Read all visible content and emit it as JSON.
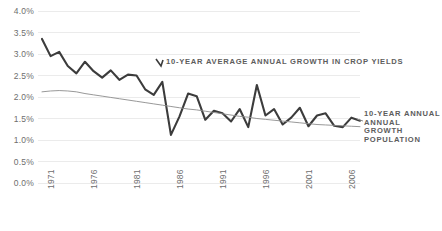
{
  "chart_data": {
    "type": "line",
    "title": "",
    "xlabel": "",
    "ylabel": "",
    "ylim": [
      0.0,
      4.0
    ],
    "ytick_labels": [
      "0.0%",
      "0.5%",
      "1.0%",
      "1.5%",
      "2.0%",
      "2.5%",
      "3.0%",
      "3.5%",
      "4.0%"
    ],
    "ytick_values": [
      0.0,
      0.5,
      1.0,
      1.5,
      2.0,
      2.5,
      3.0,
      3.5,
      4.0
    ],
    "xtick_labels": [
      "1971",
      "1976",
      "1981",
      "1986",
      "1991",
      "1996",
      "2001",
      "2006"
    ],
    "xtick_values": [
      1971,
      1976,
      1981,
      1986,
      1991,
      1996,
      2001,
      2006
    ],
    "xlim": [
      1971,
      2008
    ],
    "grid": true,
    "grid_axis": "y",
    "legend": "annotations-inline",
    "x": [
      1971,
      1972,
      1973,
      1974,
      1975,
      1976,
      1977,
      1978,
      1979,
      1980,
      1981,
      1982,
      1983,
      1984,
      1985,
      1986,
      1987,
      1988,
      1989,
      1990,
      1991,
      1992,
      1993,
      1994,
      1995,
      1996,
      1997,
      1998,
      1999,
      2000,
      2001,
      2002,
      2003,
      2004,
      2005,
      2006,
      2007,
      2008
    ],
    "series": [
      {
        "name": "10-year average annual growth in crop yields",
        "color": "#3c3c3c",
        "width": 2.1,
        "values": [
          3.35,
          2.95,
          3.05,
          2.72,
          2.55,
          2.82,
          2.6,
          2.45,
          2.62,
          2.4,
          2.52,
          2.5,
          2.18,
          2.05,
          2.35,
          1.12,
          1.55,
          2.08,
          2.02,
          1.47,
          1.68,
          1.62,
          1.43,
          1.72,
          1.3,
          2.28,
          1.57,
          1.72,
          1.36,
          1.52,
          1.75,
          1.32,
          1.57,
          1.62,
          1.33,
          1.3,
          1.52,
          1.45
        ]
      },
      {
        "name": "10-year annual annual growth population",
        "color": "#8c8c8c",
        "width": 0.9,
        "values": [
          2.12,
          2.14,
          2.15,
          2.14,
          2.12,
          2.08,
          2.05,
          2.02,
          1.99,
          1.96,
          1.93,
          1.9,
          1.87,
          1.84,
          1.81,
          1.78,
          1.75,
          1.72,
          1.7,
          1.67,
          1.64,
          1.61,
          1.58,
          1.55,
          1.53,
          1.5,
          1.48,
          1.46,
          1.44,
          1.42,
          1.4,
          1.38,
          1.36,
          1.35,
          1.34,
          1.33,
          1.32,
          1.31
        ]
      }
    ],
    "annotations": [
      {
        "id": "crop-yields-label",
        "text": "10-YEAR AVERAGE ANNUAL GROWTH IN CROP YIELDS",
        "color": "#5d5d5d"
      },
      {
        "id": "population-label",
        "line1": "10-YEAR ANNUAL",
        "line2": "ANNUAL",
        "line3": "GROWTH",
        "line4": "POPULATION",
        "color": "#5d5d5d"
      }
    ],
    "style": {
      "background": "#ffffff",
      "gridline_color": "#ebebeb",
      "axis_text_color": "#6e6e6e"
    }
  }
}
